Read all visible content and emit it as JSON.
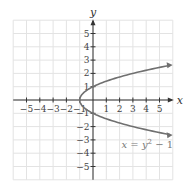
{
  "chart_data": {
    "type": "line",
    "title": "",
    "xlabel": "x",
    "ylabel": "y",
    "xlim": [
      -6,
      6
    ],
    "ylim": [
      -6,
      6
    ],
    "grid": true,
    "x_ticks": [
      -5,
      -4,
      -3,
      -2,
      -1,
      1,
      2,
      3,
      4,
      5
    ],
    "y_ticks": [
      5,
      4,
      3,
      2,
      1,
      -1,
      -2,
      -3,
      -4,
      -5
    ],
    "x_tick_labels": [
      "−5",
      "−4",
      "−3",
      "−2",
      "−1",
      "1",
      "2",
      "3",
      "4",
      "5"
    ],
    "y_tick_labels": [
      "5",
      "4",
      "3",
      "2",
      "1",
      "−1",
      "−2",
      "−3",
      "−4",
      "−5"
    ],
    "series": [
      {
        "name": "x = y² − 1",
        "color": "#707070",
        "points": [
          [
            5.8,
            2.6
          ],
          [
            3,
            2
          ],
          [
            0,
            1
          ],
          [
            -1,
            0
          ],
          [
            0,
            -1
          ],
          [
            3,
            -2
          ],
          [
            5.8,
            -2.6
          ]
        ]
      }
    ],
    "annotations": [
      {
        "text_parts": [
          "x = y",
          "2",
          " − 1"
        ],
        "position": [
          3.5,
          -3.3
        ]
      }
    ],
    "legend": "none"
  }
}
